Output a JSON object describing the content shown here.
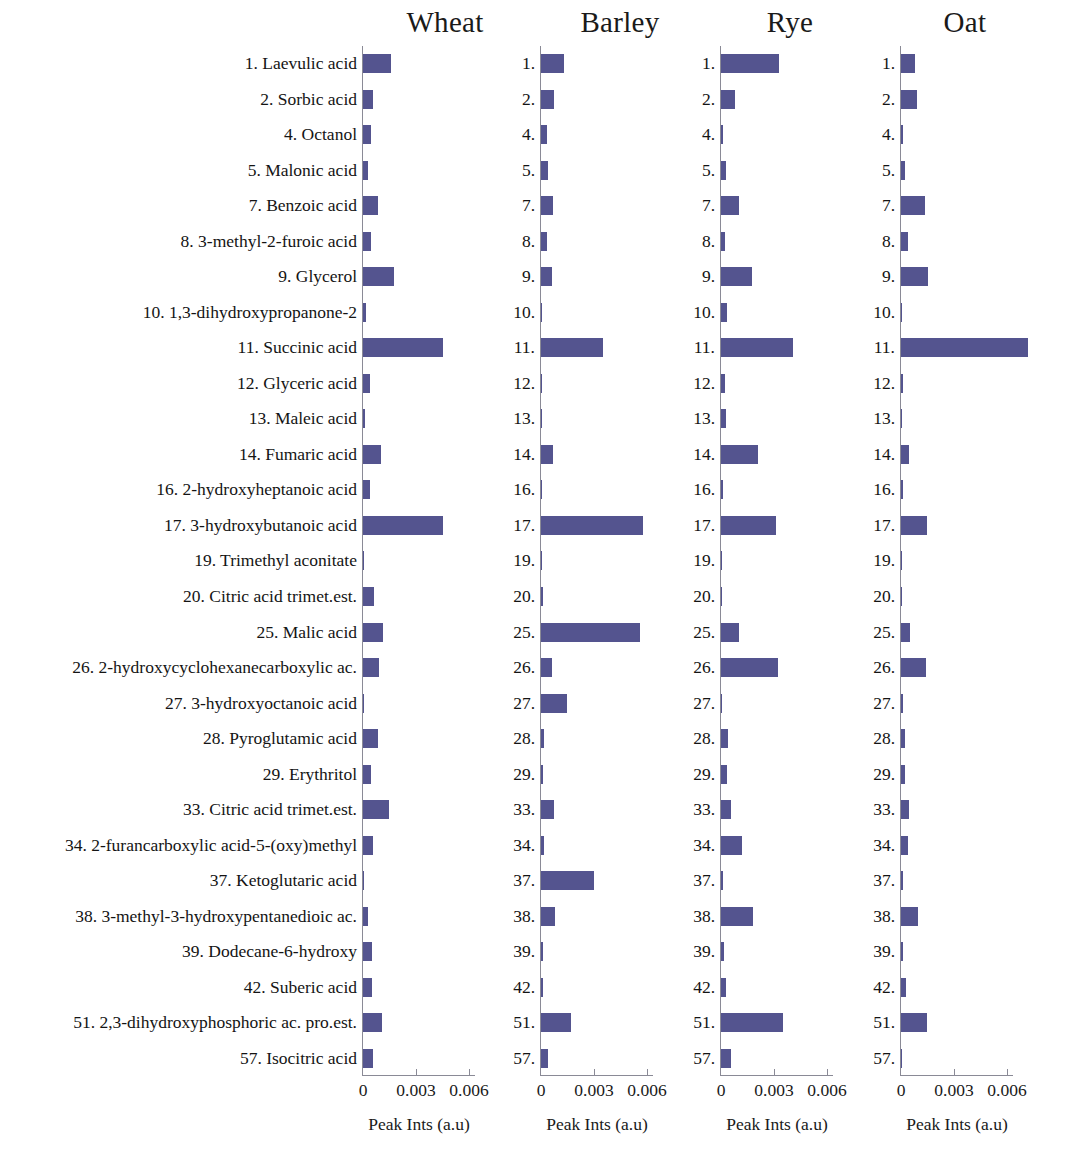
{
  "figure": {
    "background": "#ffffff",
    "bar_color": "#54548f",
    "axis_color": "#8a8a96"
  },
  "chart_data": {
    "type": "bar",
    "orientation": "horizontal",
    "title": "",
    "xlabel": "Peak Ints (a.u)",
    "ylabel": "",
    "xlim": [
      0,
      0.0075
    ],
    "xticks": [
      0,
      0.003,
      0.006
    ],
    "xticklabels": [
      "0",
      "0.003",
      "0.006"
    ],
    "grid": false,
    "legend": "none",
    "panel_titles": [
      "Wheat",
      "Barley",
      "Rye",
      "Oat"
    ],
    "categories": [
      "1. Laevulic acid",
      "2. Sorbic acid",
      "4. Octanol",
      "5. Malonic acid",
      "7. Benzoic acid",
      "8. 3-methyl-2-furoic acid",
      "9. Glycerol",
      "10. 1,3-dihydroxypropanone-2",
      "11. Succinic acid",
      "12. Glyceric acid",
      "13. Maleic acid",
      "14. Fumaric acid",
      "16. 2-hydroxyheptanoic acid",
      "17. 3-hydroxybutanoic acid",
      "19. Trimethyl aconitate",
      "20. Citric acid trimet.est.",
      "25. Malic acid",
      "26. 2-hydroxycyclohexanecarboxylic ac.",
      "27. 3-hydroxyoctanoic acid",
      "28. Pyroglutamic acid",
      "29. Erythritol",
      "33. Citric acid trimet.est.",
      "34. 2-furancarboxylic acid-5-(oxy)methyl",
      "37. Ketoglutaric acid",
      "38. 3-methyl-3-hydroxypentanedioic ac.",
      "39. Dodecane-6-hydroxy",
      "42. Suberic acid",
      "51. 2,3-dihydroxyphosphoric ac. pro.est.",
      "57. Isocitric acid"
    ],
    "category_numbers": [
      "1.",
      "2.",
      "4.",
      "5.",
      "7.",
      "8.",
      "9.",
      "10.",
      "11.",
      "12.",
      "13.",
      "14.",
      "16.",
      "17.",
      "19.",
      "20.",
      "25.",
      "26.",
      "27.",
      "28.",
      "29.",
      "33.",
      "34.",
      "37.",
      "38.",
      "39.",
      "42.",
      "51.",
      "57."
    ],
    "series": [
      {
        "name": "Wheat",
        "values": [
          0.00158,
          0.00055,
          0.00045,
          0.0003,
          0.00085,
          0.00048,
          0.00175,
          0.00018,
          0.0045,
          0.00042,
          0.00012,
          0.001,
          0.00038,
          0.0045,
          5e-05,
          0.00062,
          0.00115,
          0.0009,
          4e-05,
          0.00085,
          0.00048,
          0.00145,
          0.00058,
          4e-05,
          0.00028,
          0.0005,
          0.0005,
          0.0011,
          0.00055
        ]
      },
      {
        "name": "Barley",
        "values": [
          0.0013,
          0.00075,
          0.00035,
          0.0004,
          0.0007,
          0.00032,
          0.0006,
          8e-05,
          0.0035,
          5e-05,
          8e-05,
          0.0007,
          8e-05,
          0.0058,
          4e-05,
          0.00012,
          0.0056,
          0.00065,
          0.00145,
          0.00015,
          0.00012,
          0.00075,
          0.00016,
          0.003,
          0.0008,
          0.00014,
          0.00012,
          0.0017,
          0.0004
        ]
      },
      {
        "name": "Rye",
        "values": [
          0.0033,
          0.0008,
          0.00014,
          0.0003,
          0.001,
          0.00025,
          0.00175,
          0.00035,
          0.0041,
          0.00022,
          0.00028,
          0.0021,
          0.00012,
          0.0031,
          4e-05,
          8e-05,
          0.001,
          0.0032,
          8e-05,
          0.00038,
          0.00035,
          0.00058,
          0.0012,
          0.00014,
          0.0018,
          0.00015,
          0.0003,
          0.0035,
          0.00055
        ]
      },
      {
        "name": "Oat",
        "values": [
          0.0008,
          0.0009,
          0.0001,
          0.0002,
          0.00135,
          0.0004,
          0.0015,
          8e-05,
          0.0072,
          0.0001,
          4e-05,
          0.00048,
          0.00012,
          0.00145,
          4e-05,
          8e-05,
          0.0005,
          0.0014,
          0.00014,
          0.00025,
          0.00022,
          0.00045,
          0.00042,
          0.0001,
          0.00095,
          0.00014,
          0.0003,
          0.00145,
          6e-05
        ]
      }
    ]
  }
}
